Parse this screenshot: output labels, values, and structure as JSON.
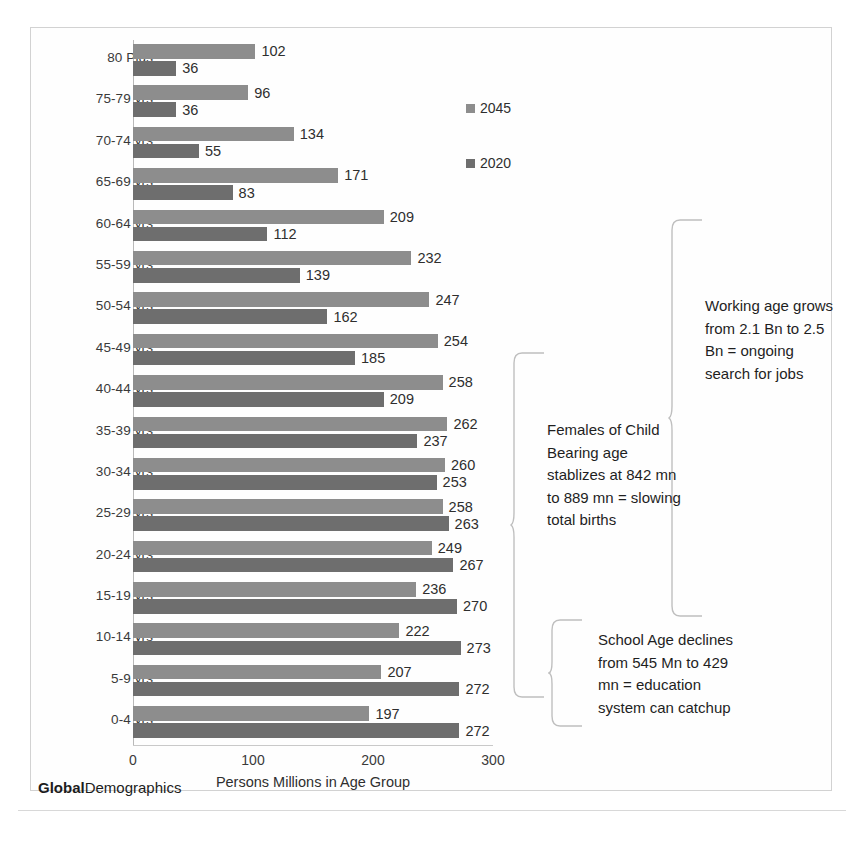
{
  "chart_data": {
    "type": "bar",
    "orientation": "horizontal",
    "title": "",
    "xlabel": "Persons Millions in Age Group",
    "ylabel": "",
    "xlim": [
      0,
      300
    ],
    "xticks": [
      0,
      100,
      200,
      300
    ],
    "grid": false,
    "legend_position": "middle-right",
    "categories": [
      "80 Plus",
      "75-79 yrs",
      "70-74 yrs",
      "65-69 yrs",
      "60-64 yrs",
      "55-59 yrs",
      "50-54 yrs",
      "45-49 yrs",
      "40-44 yrs",
      "35-39 yrs",
      "30-34 yrs",
      "25-29 yrs",
      "20-24 yrs",
      "15-19 yrs",
      "10-14 yrs",
      "5-9 yrs",
      "0-4 yrs"
    ],
    "series": [
      {
        "name": "2045",
        "color": "#8d8d8d",
        "values": [
          102,
          96,
          134,
          171,
          209,
          232,
          247,
          254,
          258,
          262,
          260,
          258,
          249,
          236,
          222,
          207,
          197
        ]
      },
      {
        "name": "2020",
        "color": "#6e6e6e",
        "values": [
          36,
          36,
          55,
          83,
          112,
          139,
          162,
          185,
          209,
          237,
          253,
          263,
          267,
          270,
          273,
          272,
          272
        ]
      }
    ]
  },
  "legend": {
    "items": [
      {
        "label": "2045",
        "color": "#8d8d8d"
      },
      {
        "label": "2020",
        "color": "#6e6e6e"
      }
    ]
  },
  "axis": {
    "x_title": "Persons Millions in Age Group",
    "ticks": [
      "0",
      "100",
      "200",
      "300"
    ]
  },
  "annotations": {
    "working_age": "Working age grows from 2.1 Bn to 2.5 Bn = ongoing search for jobs",
    "child_bearing": "Females of Child Bearing age stablizes at 842 mn to 889 mn = slowing total births",
    "school_age": "School Age declines from 545 Mn to 429 mn = education system can catchup"
  },
  "footer": {
    "brand_bold": "Global",
    "brand_rest": "Demographics"
  }
}
